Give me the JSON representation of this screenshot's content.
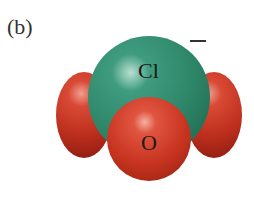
{
  "figure": {
    "panel_label": "(b)",
    "charge": "–",
    "atoms": [
      {
        "element": "O",
        "position": "left-back",
        "color": "#c0301e"
      },
      {
        "element": "O",
        "position": "right-back",
        "color": "#c0301e"
      },
      {
        "element": "Cl",
        "position": "center",
        "color": "#2d8567"
      },
      {
        "element": "O",
        "position": "front",
        "color": "#c83420"
      }
    ],
    "labels": {
      "cl": "Cl",
      "o": "O"
    }
  }
}
